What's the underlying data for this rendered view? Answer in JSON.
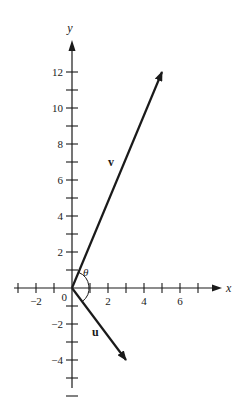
{
  "diagram": {
    "type": "vector-diagram",
    "origin_px": [
      72,
      288
    ],
    "unit_px": 18,
    "axes": {
      "x": {
        "label": "x",
        "ticks_from": -3,
        "ticks_to": 7,
        "labeled": [
          -2,
          2,
          4,
          6
        ],
        "tick_labels": [
          "−2",
          "2",
          "4",
          "6"
        ]
      },
      "y": {
        "label": "y",
        "ticks_from": -6,
        "ticks_to": 12,
        "labeled": [
          -4,
          -2,
          2,
          4,
          6,
          8,
          10,
          12
        ],
        "tick_labels": [
          "−4",
          "−2",
          "2",
          "4",
          "6",
          "8",
          "10",
          "12"
        ]
      },
      "origin_label": "0"
    },
    "vectors": [
      {
        "name": "v",
        "label": "v",
        "components": [
          5,
          12
        ]
      },
      {
        "name": "u",
        "label": "u",
        "components": [
          3,
          -4
        ]
      }
    ],
    "angle": {
      "label": "θ",
      "between": [
        "u",
        "v"
      ]
    },
    "colors": {
      "ink": "#1a1a1a",
      "background": "#ffffff"
    }
  }
}
